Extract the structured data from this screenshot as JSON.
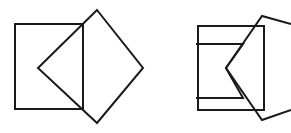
{
  "figure": {
    "canvas": {
      "width": 291,
      "height": 133,
      "background": "#ffffff"
    },
    "style": {
      "stroke_color": "#1a1a1a",
      "stroke_width": 2,
      "fill": "none"
    },
    "panels": [
      {
        "id": "left-panel",
        "label": "Square overlapped by complete diamond",
        "shapes": [
          {
            "id": "left-square",
            "name": "square",
            "type": "polygon",
            "points": "15,24 83,24 83,109 15,109"
          },
          {
            "id": "left-diamond",
            "name": "rotated-square",
            "type": "polygon",
            "points": "97,10 143,68 97,123 38,68"
          }
        ]
      },
      {
        "id": "right-panel",
        "label": "Square overlapped by diamond with chevron notch",
        "shapes": [
          {
            "id": "right-square",
            "name": "square",
            "type": "polygon",
            "points": "198,26 264,26 264,110 198,110"
          },
          {
            "id": "right-diamond",
            "name": "rotated-square-clipped",
            "type": "polyline",
            "points": "291,24 262,16 226,68 262,120 291,110"
          },
          {
            "id": "right-chevron",
            "name": "chevron-notch",
            "type": "polyline",
            "points": "196,44 243,44 226,68 243,98 196,98"
          }
        ]
      }
    ]
  }
}
